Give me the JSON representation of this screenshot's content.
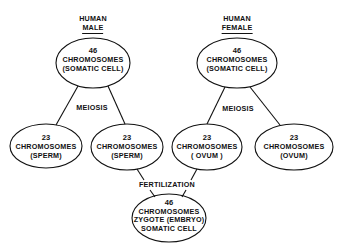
{
  "diagram": {
    "male": {
      "header_line1": "HUMAN",
      "header_line2": "MALE",
      "somatic": {
        "count": "46",
        "label": "CHROMOSOMES",
        "sub": "(SOMATIC CELL)"
      },
      "process": "MEIOSIS",
      "gamete_left": {
        "count": "23",
        "label": "CHROMOSOMES",
        "sub": "(SPERM)"
      },
      "gamete_right": {
        "count": "23",
        "label": "CHROMOSOMES",
        "sub": "(SPERM)"
      }
    },
    "female": {
      "header_line1": "HUMAN",
      "header_line2": "FEMALE",
      "somatic": {
        "count": "46",
        "label": "CHROMOSOMES",
        "sub": "(SOMATIC CELL)"
      },
      "process": "MEIOSIS",
      "gamete_left": {
        "count": "23",
        "label": "CHROMOSOMES",
        "sub": "( OVUM )"
      },
      "gamete_right": {
        "count": "23",
        "label": "CHROMOSOMES",
        "sub": "(OVUM)"
      }
    },
    "fertilization": "FERTILIZATION",
    "zygote": {
      "count": "46",
      "label": "CHROMOSOMES",
      "line3": "ZYGOTE (EMBRYO)",
      "line4": "SOMATIC CELL"
    },
    "colors": {
      "ink": "#111111",
      "background": "#ffffff"
    }
  }
}
